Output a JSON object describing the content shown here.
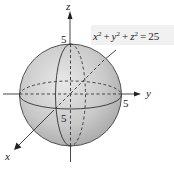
{
  "diagram": {
    "equation": {
      "lhs_x": "x",
      "lhs_y": "y",
      "lhs_z": "z",
      "exp": "2",
      "plus": "+",
      "equals": "=",
      "rhs": "25"
    },
    "axes": {
      "x_label": "x",
      "y_label": "y",
      "z_label": "z"
    },
    "intercepts": {
      "z": "5",
      "y": "5",
      "x": "5"
    },
    "colors": {
      "sphere_light": "#e6e6e6",
      "sphere_dark": "#a8a8a8",
      "line": "#333333",
      "equation_box": "#f1f1f1"
    }
  }
}
